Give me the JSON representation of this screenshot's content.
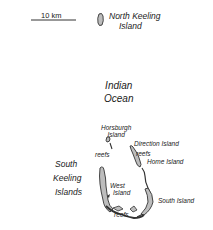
{
  "map": {
    "scale_bar": {
      "label": "10 km"
    },
    "labels": {
      "north_keeling": [
        "North Keeling",
        "Island"
      ],
      "ocean": [
        "Indian",
        "Ocean"
      ],
      "horsburgh": [
        "Horsburgh",
        "Island"
      ],
      "direction": "Direction Island",
      "home": "Home Island",
      "west": [
        "West",
        "Island"
      ],
      "south_island": "South Island",
      "south_keeling": [
        "South",
        "Keeling",
        "Islands"
      ],
      "reefs": "reefs"
    },
    "colors": {
      "land": "#bdbdbd",
      "outline": "#333333",
      "water": "#ffffff"
    }
  }
}
